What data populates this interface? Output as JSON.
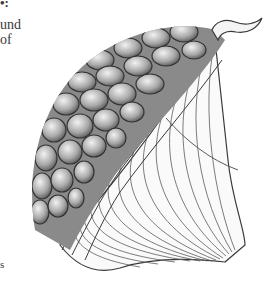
{
  "page": {
    "text_fragments": {
      "heading_fragment": "•:",
      "line1": "und",
      "line2": "of",
      "bottom": "s"
    },
    "figure": {
      "subject": "scientific-cross-section-illustration",
      "colors": {
        "outline": "#3a3a3a",
        "cell_dark": "#6e6e6e",
        "cell_light": "#e6e6e6",
        "background": "#ffffff"
      }
    }
  }
}
